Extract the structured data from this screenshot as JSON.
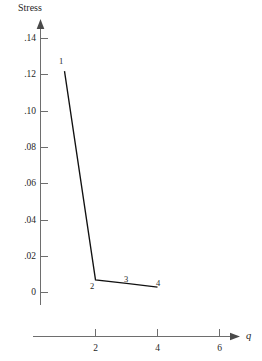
{
  "chart_data": {
    "type": "line",
    "title": "",
    "xlabel": "q",
    "ylabel": "Stress",
    "x": [
      1,
      2,
      3,
      4
    ],
    "values": [
      0.122,
      0.007,
      0.005,
      0.003
    ],
    "point_labels": [
      "1",
      "2",
      "3",
      "4"
    ],
    "xlim": [
      0,
      6.4
    ],
    "ylim": [
      0,
      0.15
    ],
    "xticks": [
      2,
      4,
      6
    ],
    "xtick_labels": [
      "2",
      "4",
      "6"
    ],
    "yticks": [
      0,
      0.02,
      0.04,
      0.06,
      0.08,
      0.1,
      0.12,
      0.14
    ],
    "ytick_labels": [
      "0",
      ".02",
      ".04",
      ".06",
      ".08",
      ".10",
      ".12",
      ".14"
    ],
    "grid": false,
    "legend": "none",
    "line_color": "#111111",
    "axis_color": "#6e6e6e",
    "series": [
      {
        "name": "Stress",
        "points": [
          {
            "label": "1",
            "q": 1,
            "stress": 0.122
          },
          {
            "label": "2",
            "q": 2,
            "stress": 0.007
          },
          {
            "label": "3",
            "q": 3,
            "stress": 0.005
          },
          {
            "label": "4",
            "q": 4,
            "stress": 0.003
          }
        ]
      }
    ]
  },
  "axes": {
    "y_title": "Stress",
    "x_title": "q",
    "y_labels": [
      ".14",
      ".12",
      ".10",
      ".08",
      ".06",
      ".04",
      ".02",
      "0"
    ],
    "x_labels": [
      "2",
      "4",
      "6"
    ]
  },
  "marks": {
    "p1": "1",
    "p2": "2",
    "p3": "3",
    "p4": "4"
  }
}
